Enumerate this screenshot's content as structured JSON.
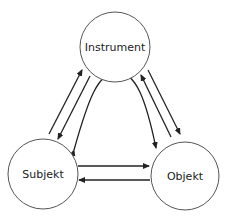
{
  "diagram": {
    "nodes": [
      {
        "id": "instrument",
        "label": "Instrument",
        "cx": 115,
        "cy": 47,
        "r": 35
      },
      {
        "id": "subjekt",
        "label": "Subjekt",
        "cx": 43,
        "cy": 174,
        "r": 35
      },
      {
        "id": "objekt",
        "label": "Objekt",
        "cx": 185,
        "cy": 176,
        "r": 34
      }
    ],
    "edges": [
      {
        "from": "subjekt",
        "to": "instrument"
      },
      {
        "from": "instrument",
        "to": "subjekt"
      },
      {
        "from": "instrument",
        "to": "objekt"
      },
      {
        "from": "objekt",
        "to": "instrument"
      },
      {
        "from": "subjekt",
        "to": "objekt"
      },
      {
        "from": "objekt",
        "to": "subjekt"
      },
      {
        "from": "subjekt",
        "to": "objekt",
        "via": "instrument",
        "shape": "arch",
        "bidirectional": true
      }
    ],
    "colors": {
      "stroke": "#222222",
      "circle_stroke": "#555555",
      "background": "#ffffff"
    }
  }
}
